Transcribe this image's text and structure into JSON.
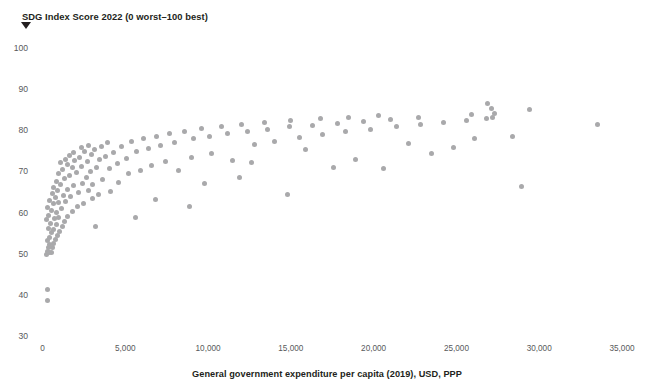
{
  "chart_data": {
    "type": "scatter",
    "title": "SDG Index Score 2022 (0 worst–100 best)",
    "xlabel": "General government expenditure per capita (2019), USD, PPP",
    "ylabel": "SDG Index Score 2022 (0 worst–100 best)",
    "grid": false,
    "legend": "none",
    "marker_color": "#a9a9ab",
    "marker_size_px": 5,
    "xlim": [
      0,
      35000
    ],
    "ylim": [
      30,
      100
    ],
    "x_ticks": [
      0,
      5000,
      10000,
      15000,
      20000,
      25000,
      30000,
      35000
    ],
    "x_tick_labels": [
      "0",
      "5,000",
      "10,000",
      "15,000",
      "20,000",
      "25,000",
      "30,000",
      "35,000"
    ],
    "y_ticks": [
      30,
      40,
      50,
      60,
      70,
      80,
      90,
      100
    ],
    "y_tick_labels": [
      "30",
      "40",
      "50",
      "60",
      "70",
      "80",
      "90",
      "100"
    ],
    "series": [
      {
        "name": "Countries",
        "points": [
          [
            300,
            38.6
          ],
          [
            330,
            41.4
          ],
          [
            250,
            49.9
          ],
          [
            300,
            50.6
          ],
          [
            420,
            50.2
          ],
          [
            360,
            51.5
          ],
          [
            520,
            50.4
          ],
          [
            450,
            52.3
          ],
          [
            600,
            51.4
          ],
          [
            300,
            53.1
          ],
          [
            680,
            52.6
          ],
          [
            420,
            54.0
          ],
          [
            760,
            53.4
          ],
          [
            540,
            55.1
          ],
          [
            900,
            54.4
          ],
          [
            350,
            56.2
          ],
          [
            640,
            56.0
          ],
          [
            1050,
            55.3
          ],
          [
            480,
            57.4
          ],
          [
            820,
            57.1
          ],
          [
            260,
            58.3
          ],
          [
            1180,
            56.5
          ],
          [
            700,
            58.6
          ],
          [
            390,
            59.4
          ],
          [
            980,
            58.9
          ],
          [
            1350,
            57.8
          ],
          [
            560,
            60.4
          ],
          [
            860,
            60.1
          ],
          [
            1520,
            59.0
          ],
          [
            300,
            61.2
          ],
          [
            1150,
            61.0
          ],
          [
            640,
            62.1
          ],
          [
            1800,
            60.2
          ],
          [
            950,
            62.4
          ],
          [
            430,
            63.0
          ],
          [
            2100,
            61.4
          ],
          [
            1400,
            62.8
          ],
          [
            760,
            63.7
          ],
          [
            2450,
            62.2
          ],
          [
            1250,
            64.1
          ],
          [
            580,
            64.6
          ],
          [
            1680,
            63.9
          ],
          [
            3000,
            63.3
          ],
          [
            900,
            65.3
          ],
          [
            2200,
            64.8
          ],
          [
            1480,
            65.7
          ],
          [
            690,
            66.2
          ],
          [
            2750,
            65.4
          ],
          [
            1100,
            66.9
          ],
          [
            3400,
            64.3
          ],
          [
            1900,
            66.5
          ],
          [
            820,
            67.6
          ],
          [
            2400,
            67.1
          ],
          [
            1350,
            68.2
          ],
          [
            4100,
            65.1
          ],
          [
            3050,
            66.8
          ],
          [
            1620,
            69.0
          ],
          [
            960,
            69.5
          ],
          [
            2650,
            68.6
          ],
          [
            2050,
            69.8
          ],
          [
            1200,
            70.4
          ],
          [
            3600,
            68.0
          ],
          [
            1820,
            70.9
          ],
          [
            4600,
            67.3
          ],
          [
            2900,
            70.1
          ],
          [
            1480,
            71.6
          ],
          [
            2350,
            71.2
          ],
          [
            1100,
            72.1
          ],
          [
            3250,
            71.0
          ],
          [
            1950,
            72.6
          ],
          [
            5200,
            69.4
          ],
          [
            2700,
            72.4
          ],
          [
            1380,
            73.0
          ],
          [
            4050,
            70.6
          ],
          [
            2250,
            73.4
          ],
          [
            1650,
            73.8
          ],
          [
            3450,
            72.9
          ],
          [
            5900,
            70.2
          ],
          [
            2950,
            74.0
          ],
          [
            1900,
            74.6
          ],
          [
            4500,
            72.0
          ],
          [
            2550,
            74.9
          ],
          [
            3800,
            73.7
          ],
          [
            6600,
            71.5
          ],
          [
            3150,
            75.3
          ],
          [
            2350,
            75.8
          ],
          [
            5100,
            73.1
          ],
          [
            4300,
            74.5
          ],
          [
            7400,
            72.4
          ],
          [
            3550,
            76.1
          ],
          [
            2750,
            76.4
          ],
          [
            5700,
            74.8
          ],
          [
            8200,
            70.2
          ],
          [
            4800,
            76.0
          ],
          [
            6400,
            75.5
          ],
          [
            3950,
            77.0
          ],
          [
            9000,
            73.3
          ],
          [
            5400,
            77.3
          ],
          [
            7100,
            76.2
          ],
          [
            10200,
            74.4
          ],
          [
            6100,
            78.1
          ],
          [
            8000,
            77.0
          ],
          [
            11500,
            72.6
          ],
          [
            6900,
            78.6
          ],
          [
            9100,
            77.9
          ],
          [
            12800,
            76.5
          ],
          [
            7700,
            79.2
          ],
          [
            10100,
            78.4
          ],
          [
            14000,
            77.2
          ],
          [
            8600,
            79.8
          ],
          [
            11200,
            79.1
          ],
          [
            15500,
            78.3
          ],
          [
            9600,
            80.5
          ],
          [
            12400,
            79.6
          ],
          [
            16900,
            79.0
          ],
          [
            10800,
            80.9
          ],
          [
            13600,
            80.2
          ],
          [
            18300,
            79.7
          ],
          [
            12000,
            81.3
          ],
          [
            14900,
            80.8
          ],
          [
            19800,
            80.3
          ],
          [
            13400,
            81.8
          ],
          [
            16300,
            81.2
          ],
          [
            21400,
            80.9
          ],
          [
            15000,
            82.3
          ],
          [
            17800,
            81.7
          ],
          [
            22800,
            81.4
          ],
          [
            16800,
            82.8
          ],
          [
            19400,
            82.2
          ],
          [
            24200,
            81.9
          ],
          [
            18500,
            83.2
          ],
          [
            21000,
            82.7
          ],
          [
            25600,
            82.4
          ],
          [
            20300,
            83.6
          ],
          [
            22700,
            83.1
          ],
          [
            26800,
            82.9
          ],
          [
            26900,
            86.5
          ],
          [
            27100,
            85.4
          ],
          [
            27300,
            84.2
          ],
          [
            27200,
            83.0
          ],
          [
            25900,
            83.8
          ],
          [
            29400,
            85.1
          ],
          [
            28400,
            78.6
          ],
          [
            26100,
            78.0
          ],
          [
            23500,
            74.3
          ],
          [
            20600,
            70.6
          ],
          [
            17600,
            70.9
          ],
          [
            14800,
            64.4
          ],
          [
            11900,
            68.6
          ],
          [
            8900,
            61.4
          ],
          [
            5600,
            58.9
          ],
          [
            3200,
            56.6
          ],
          [
            6800,
            63.2
          ],
          [
            9800,
            67.0
          ],
          [
            12600,
            72.2
          ],
          [
            15900,
            75.4
          ],
          [
            18900,
            73.0
          ],
          [
            22100,
            76.7
          ],
          [
            24800,
            75.8
          ],
          [
            28900,
            66.3
          ],
          [
            33500,
            81.4
          ]
        ]
      }
    ]
  },
  "axes": {
    "x_title": "General government expenditure per capita (2019), USD, PPP",
    "y_title": "SDG Index Score 2022 (0 worst–100 best)"
  }
}
